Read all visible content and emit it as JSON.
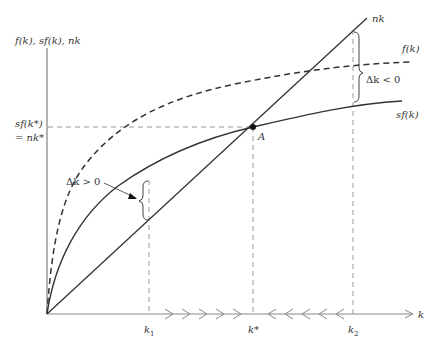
{
  "diagram": {
    "y_axis_label": "f(k), sf(k), nk",
    "x_axis_label": "k",
    "steady_state_y_label_line1": "sf(k*)",
    "steady_state_y_label_line2": "= nk*",
    "curves": [
      {
        "name": "f(k)",
        "style": "dashed"
      },
      {
        "name": "sf(k)",
        "style": "solid"
      },
      {
        "name": "nk",
        "style": "solid-line"
      }
    ],
    "point_label": "A",
    "x_ticks": [
      {
        "label": "k",
        "sub": "1"
      },
      {
        "label": "k*",
        "sub": ""
      },
      {
        "label": "k",
        "sub": "2"
      }
    ],
    "annotations": {
      "left_gap": "Δk > 0",
      "right_gap": "Δk < 0"
    },
    "colors": {
      "curve": "#333333",
      "axis": "#555555",
      "guide": "#999999"
    }
  }
}
